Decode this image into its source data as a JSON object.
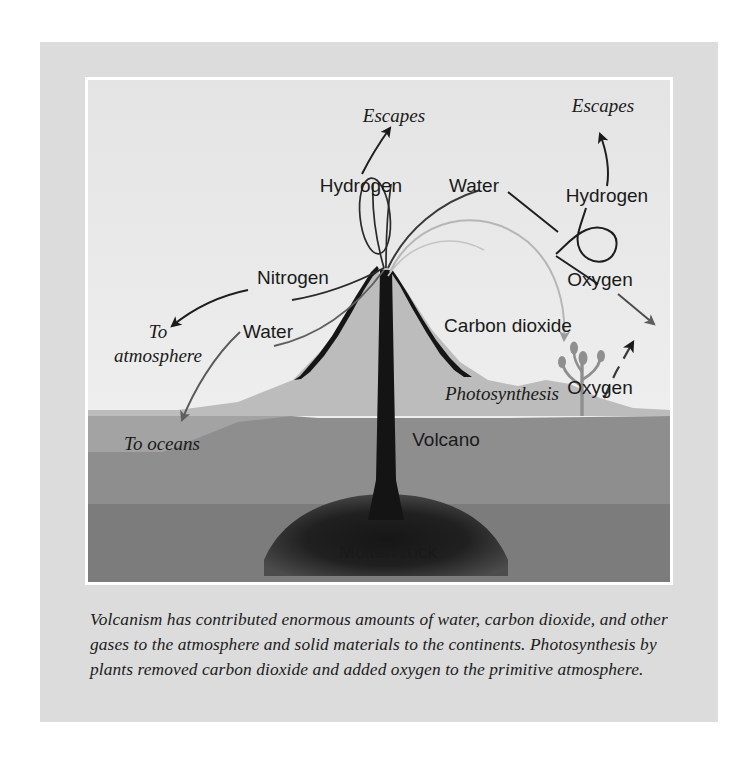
{
  "figure": {
    "caption": "Volcanism has contributed enormous amounts of water, carbon dioxide, and other gases to the atmosphere and solid materials to the continents. Photosynthesis by plants removed carbon dioxide and added oxygen to the primitive atmosphere."
  },
  "colors": {
    "panel_background": "#dcdcdc",
    "mat_white": "#ffffff",
    "sky": "#e9e9e9",
    "terrain": "#b9b9b9",
    "subsurface": "#8c8c8c",
    "deep_rock": "#787878",
    "molten_rock": "#1a1a1a",
    "ink": "#1a1a1a",
    "faint_arrow": "#b0b0b0",
    "mid_arrow": "#6e6e6e"
  },
  "labels": {
    "escapes_left": "Escapes",
    "escapes_right": "Escapes",
    "hydrogen_center": "Hydrogen",
    "hydrogen_right": "Hydrogen",
    "nitrogen": "Nitrogen",
    "water_left": "Water",
    "water_right": "Water",
    "to_atmosphere_line1": "To",
    "to_atmosphere_line2": "atmosphere",
    "to_oceans": "To oceans",
    "carbon_dioxide": "Carbon dioxide",
    "oxygen_upper": "Oxygen",
    "oxygen_lower": "Oxygen",
    "photosynthesis": "Photosynthesis",
    "volcano": "Volcano",
    "molten_rock": "Molten rock"
  },
  "diagram": {
    "type": "labeled-cross-section",
    "vent_x": 298,
    "vent_y": 300,
    "flows": [
      {
        "name": "hydrogen-escape",
        "from": "vent",
        "to": "escapes-left",
        "style": "solid-arrow"
      },
      {
        "name": "nitrogen-to-atmosphere",
        "from": "vent",
        "to": "to-atmosphere",
        "style": "solid-arrow"
      },
      {
        "name": "water-to-oceans",
        "from": "vent",
        "to": "to-oceans",
        "style": "solid-arrow"
      },
      {
        "name": "water-right-flow",
        "from": "vent",
        "to": "oxygen-upper",
        "style": "solid-arrow"
      },
      {
        "name": "carbon-dioxide-to-plant",
        "from": "vent",
        "to": "photosynthesis",
        "style": "faint-arrow"
      },
      {
        "name": "oxygen-from-plant",
        "from": "photosynthesis",
        "to": "oxygen-escape",
        "style": "dashed-arrow"
      },
      {
        "name": "hydrogen-right-escape",
        "from": "loop",
        "to": "escapes-right",
        "style": "solid-arrow"
      }
    ]
  }
}
